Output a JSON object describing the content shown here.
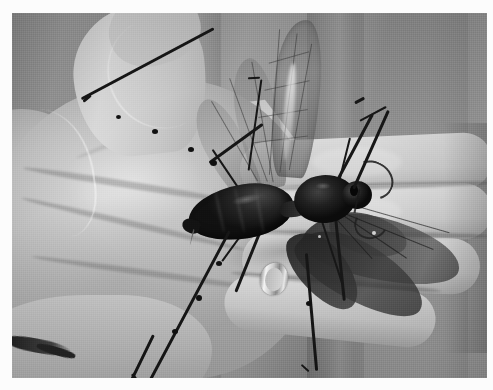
{
  "image": {
    "kind": "photograph",
    "color_mode": "grayscale",
    "width": 493,
    "height": 390,
    "border": {
      "color": "#fcfcfc",
      "inset_left": 12,
      "inset_top": 13
    },
    "alt_text": "Black-and-white photograph of a very large winged insect, a tarantula hawk wasp, resting across the palm and fingers of an open human hand."
  },
  "scene": {
    "subject_label": "large winged insect on open human hand",
    "background_label": "gray curtain or drape with vertical folds",
    "lighting_label": "bright backlight through gap between fingers",
    "objects": [
      {
        "name": "human-hand",
        "description": "open palm facing camera, fingers extending to the right"
      },
      {
        "name": "insect-body",
        "description": "dark segmented abdomen, thorax and head"
      },
      {
        "name": "upper-wings",
        "description": "three translucent veined wings raised upward"
      },
      {
        "name": "lower-wings",
        "description": "dark spread wings angled down to the right over the fingers"
      },
      {
        "name": "antennae",
        "description": "two very long dark antennae crossing the palm diagonally"
      },
      {
        "name": "legs",
        "description": "spiny legs radiating from the thorax"
      },
      {
        "name": "silver-ring",
        "description": "plain silver band on the ring finger"
      },
      {
        "name": "backlight-highlight",
        "description": "bright white triangular patch between thumb and index finger"
      }
    ],
    "palette": {
      "curtain_gray": "#9a9a9a",
      "skin_light": "#ddd9d2",
      "skin_mid": "#c6c2ba",
      "skin_shadow": "#a8a49c",
      "insect_dark": "#1b1917",
      "insect_highlight": "#4a4644",
      "wing_translucent": "#8f8b85",
      "highlight_white": "#fbfbf8",
      "ring_silver": "#d6d2cb"
    }
  }
}
